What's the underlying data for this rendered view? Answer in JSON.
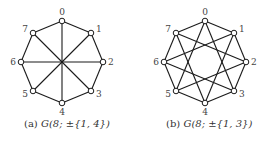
{
  "figures": [
    {
      "id": "a",
      "caption_prefix": "(a)",
      "caption_math": "G(8; ±{1, 4})",
      "n": 8,
      "jumps": [
        1,
        4
      ],
      "center": [
        62,
        62
      ],
      "radius": 41,
      "node_labels": [
        "0",
        "1",
        "2",
        "3",
        "4",
        "5",
        "6",
        "7"
      ]
    },
    {
      "id": "b",
      "caption_prefix": "(b)",
      "caption_math": "G(8; ±{1, 3})",
      "n": 8,
      "jumps": [
        1,
        3
      ],
      "center": [
        205,
        62
      ],
      "radius": 41,
      "node_labels": [
        "0",
        "1",
        "2",
        "3",
        "4",
        "5",
        "6",
        "7"
      ]
    }
  ],
  "colors": {
    "edge": "#1a1a1a",
    "node_fill": "#ffffff",
    "node_stroke": "#1a1a1a"
  }
}
